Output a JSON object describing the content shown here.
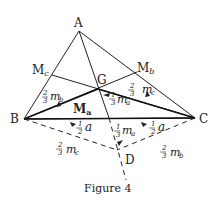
{
  "figure": {
    "caption": "Figure 4",
    "vertices": {
      "A": "A",
      "B": "B",
      "C": "C",
      "G": "G",
      "D": "D",
      "Mb": "M",
      "Mb_sub": "b",
      "Mc": "M",
      "Mc_sub": "c",
      "Ma": "M",
      "Ma_sub": "a"
    },
    "segment_labels": {
      "two_thirds_mb": {
        "num": "2",
        "den": "3",
        "var": "m",
        "sub": "b"
      },
      "two_thirds_mc": {
        "num": "2",
        "den": "3",
        "var": "m",
        "sub": "c"
      },
      "one_third_ma_upper": {
        "num": "1",
        "den": "3",
        "var": "m",
        "sub": "a"
      },
      "one_third_ma_lower": {
        "num": "1",
        "den": "3",
        "var": "m",
        "sub": "a"
      },
      "half_a_left": {
        "num": "1",
        "den": "2",
        "var": "a"
      },
      "half_a_right": {
        "num": "1",
        "den": "2",
        "var": "a"
      },
      "two_thirds_mc_dashed": {
        "num": "2",
        "den": "3",
        "var": "m",
        "sub": "c"
      },
      "two_thirds_mb_dashed": {
        "num": "2",
        "den": "3",
        "var": "m",
        "sub": "b"
      }
    },
    "colors": {
      "line": "#222222",
      "background": "#ffffff"
    }
  }
}
